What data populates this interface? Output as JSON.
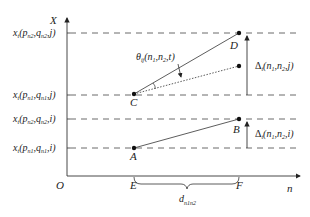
{
  "diagram": {
    "axes": {
      "y_label": "X",
      "x_label": "n",
      "origin_label": "O"
    },
    "y_levels": [
      {
        "id": "top_j",
        "text": "x",
        "sub1": "t",
        "rest_open": "(p",
        "p_sub": "n2",
        "mid": ",q",
        "q_sub": "n2",
        "tail": ",j)"
      },
      {
        "id": "low_j",
        "text": "x",
        "sub1": "t",
        "rest_open": "(p",
        "p_sub": "n1",
        "mid": ",q",
        "q_sub": "n1",
        "tail": ",j)"
      },
      {
        "id": "top_i",
        "text": "x",
        "sub1": "t",
        "rest_open": "(p",
        "p_sub": "n2",
        "mid": ",q",
        "q_sub": "n2",
        "tail": ",i)"
      },
      {
        "id": "low_i",
        "text": "x",
        "sub1": "t",
        "rest_open": "(p",
        "p_sub": "n1",
        "mid": ",q",
        "q_sub": "n1",
        "tail": ",i)"
      }
    ],
    "points": {
      "A": "A",
      "B": "B",
      "C": "C",
      "D": "D",
      "E": "E",
      "F": "F"
    },
    "angle_label": {
      "symbol": "θ",
      "sub": "ij",
      "args": "(n",
      "a1": "1",
      "mid": ",n",
      "a2": "2",
      "tail": ",t)"
    },
    "delta_j": {
      "symbol": "Δ",
      "sub": "t",
      "args": "(n",
      "a1": "1",
      "mid": ",n",
      "a2": "2",
      "tail": ",j)"
    },
    "delta_i": {
      "symbol": "Δ",
      "sub": "t",
      "args": "(n",
      "a1": "1",
      "mid": ",n",
      "a2": "2",
      "tail": ",i)"
    },
    "distance_label": {
      "symbol": "d",
      "sub": "n1n2"
    },
    "colors": {
      "ink": "#222222",
      "background": "#ffffff"
    }
  }
}
